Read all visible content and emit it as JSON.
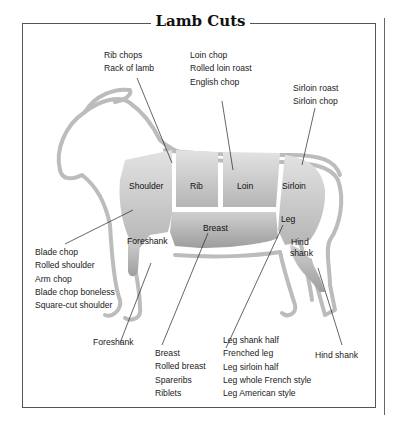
{
  "title": "Lamb Cuts",
  "colors": {
    "outline": "#b9b9b9",
    "cut_fill": "#c9c9c9",
    "cut_fill_dark": "#a9a9a9",
    "leader": "#222222",
    "frame": "#555555"
  },
  "cuts": {
    "shoulder": "Shoulder",
    "rib": "Rib",
    "loin": "Loin",
    "sirloin": "Sirloin",
    "breast": "Breast",
    "leg": "Leg",
    "foreshank": "Foreshank",
    "hind_shank_1": "Hind",
    "hind_shank_2": "shank"
  },
  "callouts": {
    "rib": [
      "Rib chops",
      "Rack of lamb"
    ],
    "loin": [
      "Loin chop",
      "Rolled loin roast",
      "English chop"
    ],
    "sirloin": [
      "Sirloin roast",
      "Sirloin chop"
    ],
    "shoulder": [
      "Blade chop",
      "Rolled shoulder",
      "Arm chop",
      "Blade chop boneless",
      "Square-cut shoulder"
    ],
    "foreshank": [
      "Foreshank"
    ],
    "breast": [
      "Breast",
      "Rolled breast",
      "Spareribs",
      "Riblets"
    ],
    "leg": [
      "Leg shank half",
      "Frenched leg",
      "Leg sirloin half",
      "Leg whole French style",
      "Leg American style"
    ],
    "hind_shank": [
      "Hind shank"
    ]
  }
}
